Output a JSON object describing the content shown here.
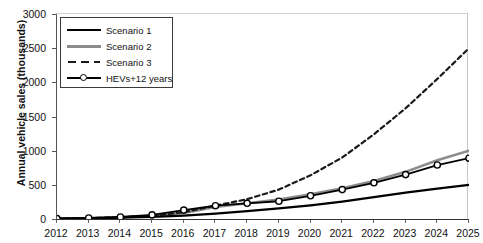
{
  "chart_data": {
    "type": "line",
    "title": "",
    "xlabel": "",
    "ylabel": "Annual vehicle sales (thousands)",
    "x": [
      2012,
      2013,
      2014,
      2015,
      2016,
      2017,
      2018,
      2019,
      2020,
      2021,
      2022,
      2023,
      2024,
      2025
    ],
    "xtick_labels": [
      "2012",
      "2013",
      "2014",
      "2015",
      "2016",
      "2017",
      "2018",
      "2019",
      "2020",
      "2021",
      "2022",
      "2023",
      "2024",
      "2025"
    ],
    "ytick_labels": [
      "0",
      "500",
      "1000",
      "1500",
      "2000",
      "2500",
      "3000"
    ],
    "ytick_values": [
      0,
      500,
      1000,
      1500,
      2000,
      2500,
      3000
    ],
    "xlim": [
      2012,
      2025
    ],
    "ylim": [
      0,
      3000
    ],
    "grid": false,
    "legend_position": "upper left",
    "series": [
      {
        "name": "Scenario 1",
        "style": "solid",
        "color": "#000000",
        "width": 2.2,
        "markers": false,
        "values": [
          5,
          10,
          18,
          30,
          50,
          80,
          115,
          155,
          200,
          255,
          320,
          385,
          445,
          500
        ]
      },
      {
        "name": "Scenario 2",
        "style": "solid",
        "color": "#8c8c8c",
        "width": 2.6,
        "markers": false,
        "values": [
          5,
          12,
          25,
          45,
          90,
          175,
          230,
          285,
          360,
          450,
          555,
          690,
          860,
          1000
        ]
      },
      {
        "name": "Scenario 3",
        "style": "dashed",
        "color": "#1a1a1a",
        "width": 2.2,
        "markers": false,
        "values": [
          5,
          12,
          25,
          48,
          100,
          195,
          290,
          430,
          640,
          900,
          1240,
          1620,
          2050,
          2500
        ]
      },
      {
        "name": "HEVs+12 years",
        "style": "solid-markers",
        "color": "#000000",
        "width": 1.8,
        "markers": true,
        "marker_shape": "circle",
        "values": [
          5,
          15,
          30,
          60,
          130,
          195,
          230,
          260,
          340,
          430,
          530,
          650,
          790,
          890
        ]
      }
    ]
  },
  "legend": {
    "items": [
      {
        "label": "Scenario 1"
      },
      {
        "label": "Scenario 2"
      },
      {
        "label": "Scenario 3"
      },
      {
        "label": "HEVs+12 years"
      }
    ]
  }
}
